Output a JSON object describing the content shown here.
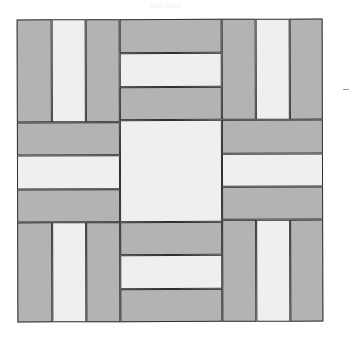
{
  "caption": "quilt block",
  "colors": {
    "dark": "#b3b3b3",
    "light": "#efefef",
    "line": "#2f2f2f"
  },
  "quilt": {
    "grid": "3x3 rail-fence blocks with plain center square",
    "pieces": [
      {
        "name": "tl-rail-1",
        "x": 0,
        "y": 0,
        "w": 35,
        "h": 103,
        "tone": "dark"
      },
      {
        "name": "tl-rail-2",
        "x": 35,
        "y": 0,
        "w": 34,
        "h": 103,
        "tone": "light"
      },
      {
        "name": "tl-rail-3",
        "x": 69,
        "y": 0,
        "w": 34,
        "h": 103,
        "tone": "dark"
      },
      {
        "name": "tm-rail-1",
        "x": 103,
        "y": 0,
        "w": 102,
        "h": 34,
        "tone": "dark"
      },
      {
        "name": "tm-rail-2",
        "x": 103,
        "y": 34,
        "w": 102,
        "h": 34,
        "tone": "light"
      },
      {
        "name": "tm-rail-3",
        "x": 103,
        "y": 68,
        "w": 102,
        "h": 33,
        "tone": "dark"
      },
      {
        "name": "tr-rail-1",
        "x": 205,
        "y": 0,
        "w": 34,
        "h": 101,
        "tone": "dark"
      },
      {
        "name": "tr-rail-2",
        "x": 239,
        "y": 0,
        "w": 34,
        "h": 101,
        "tone": "light"
      },
      {
        "name": "tr-rail-3",
        "x": 273,
        "y": 0,
        "w": 33,
        "h": 101,
        "tone": "dark"
      },
      {
        "name": "ml-rail-1",
        "x": 0,
        "y": 103,
        "w": 103,
        "h": 33,
        "tone": "dark"
      },
      {
        "name": "ml-rail-2",
        "x": 0,
        "y": 136,
        "w": 103,
        "h": 34,
        "tone": "light"
      },
      {
        "name": "ml-rail-3",
        "x": 0,
        "y": 170,
        "w": 103,
        "h": 33,
        "tone": "dark"
      },
      {
        "name": "center-square",
        "x": 103,
        "y": 101,
        "w": 102,
        "h": 102,
        "tone": "light"
      },
      {
        "name": "mr-rail-1",
        "x": 205,
        "y": 101,
        "w": 101,
        "h": 34,
        "tone": "dark"
      },
      {
        "name": "mr-rail-2",
        "x": 205,
        "y": 135,
        "w": 101,
        "h": 33,
        "tone": "light"
      },
      {
        "name": "mr-rail-3",
        "x": 205,
        "y": 168,
        "w": 101,
        "h": 33,
        "tone": "dark"
      },
      {
        "name": "bl-rail-1",
        "x": 0,
        "y": 203,
        "w": 35,
        "h": 100,
        "tone": "dark"
      },
      {
        "name": "bl-rail-2",
        "x": 35,
        "y": 203,
        "w": 34,
        "h": 100,
        "tone": "light"
      },
      {
        "name": "bl-rail-3",
        "x": 69,
        "y": 203,
        "w": 34,
        "h": 100,
        "tone": "dark"
      },
      {
        "name": "bm-rail-1",
        "x": 103,
        "y": 203,
        "w": 102,
        "h": 33,
        "tone": "dark"
      },
      {
        "name": "bm-rail-2",
        "x": 103,
        "y": 236,
        "w": 102,
        "h": 34,
        "tone": "light"
      },
      {
        "name": "bm-rail-3",
        "x": 103,
        "y": 270,
        "w": 102,
        "h": 33,
        "tone": "dark"
      },
      {
        "name": "br-rail-1",
        "x": 205,
        "y": 201,
        "w": 34,
        "h": 102,
        "tone": "dark"
      },
      {
        "name": "br-rail-2",
        "x": 239,
        "y": 201,
        "w": 34,
        "h": 102,
        "tone": "light"
      },
      {
        "name": "br-rail-3",
        "x": 273,
        "y": 201,
        "w": 33,
        "h": 102,
        "tone": "dark"
      }
    ]
  }
}
